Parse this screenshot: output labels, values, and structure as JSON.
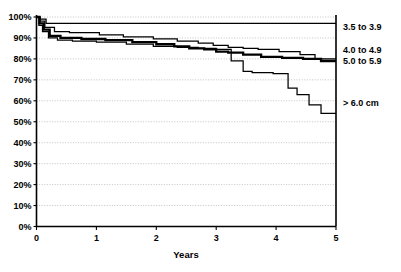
{
  "chart_data": {
    "type": "line",
    "title": "",
    "subtitle": "",
    "xlabel": "Years",
    "ylabel": "",
    "xlim": [
      0,
      5
    ],
    "ylim": [
      0,
      100
    ],
    "grid": true,
    "legend_position": "right",
    "x_ticks": [
      "0",
      "1",
      "2",
      "3",
      "4",
      "5"
    ],
    "x_tick_values": [
      0,
      1,
      2,
      3,
      4,
      5
    ],
    "y_ticks": [
      "0%",
      "10%",
      "20%",
      "30%",
      "40%",
      "50%",
      "60%",
      "70%",
      "80%",
      "90%",
      "100%"
    ],
    "y_tick_values": [
      0,
      10,
      20,
      30,
      40,
      50,
      60,
      70,
      80,
      90,
      100
    ],
    "step_type": "post",
    "series": [
      {
        "name": "3.5 to 3.9",
        "label": "3.5 to 3.9",
        "color": "#000000",
        "line_weight": "thin",
        "final_value": 97,
        "x": [
          0,
          0.06,
          0.16,
          5
        ],
        "y": [
          100,
          99,
          97,
          97
        ]
      },
      {
        "name": "4.0 to 4.9",
        "label": "4.0 to 4.9",
        "color": "#000000",
        "line_weight": "thin",
        "final_value": 80,
        "x": [
          0,
          0.06,
          0.14,
          0.3,
          0.55,
          1.05,
          1.45,
          1.95,
          2.35,
          2.7,
          2.95,
          3.2,
          3.45,
          3.7,
          4.05,
          4.4,
          4.65,
          5
        ],
        "y": [
          100,
          98,
          95,
          93,
          92.5,
          91.5,
          90.5,
          89.5,
          88.5,
          87.5,
          86.5,
          85.5,
          85,
          84.5,
          83.5,
          82,
          80,
          80
        ]
      },
      {
        "name": "5.0 to 5.9",
        "label": "5.0 to 5.9",
        "color": "#000000",
        "line_weight": "thick",
        "final_value": 79,
        "x": [
          0,
          0.05,
          0.12,
          0.22,
          0.4,
          0.75,
          1.15,
          1.6,
          2.0,
          2.3,
          2.55,
          2.8,
          3.0,
          3.2,
          3.45,
          3.75,
          4.1,
          4.45,
          4.75,
          5
        ],
        "y": [
          100,
          97,
          94,
          91,
          90,
          89.5,
          89,
          88,
          87,
          86,
          85,
          84.5,
          83.5,
          83,
          82,
          81,
          80.5,
          80,
          79,
          79
        ]
      },
      {
        "name": "> 6.0 cm",
        "label": "> 6.0 cm",
        "color": "#000000",
        "line_weight": "thin",
        "final_value": 54,
        "x": [
          0,
          0.04,
          0.1,
          0.2,
          0.35,
          0.6,
          1.0,
          1.5,
          1.95,
          2.35,
          2.7,
          3.0,
          3.25,
          3.45,
          3.6,
          3.95,
          4.2,
          4.35,
          4.55,
          4.75,
          5
        ],
        "y": [
          100,
          96,
          93,
          90,
          89,
          88.5,
          88,
          87,
          86,
          85.5,
          85,
          84.5,
          79,
          74,
          73.5,
          73,
          66,
          63,
          58,
          54,
          54
        ]
      }
    ],
    "legend_entries": [
      {
        "label": "3.5 to 3.9",
        "y_percent": 95.5
      },
      {
        "label": "4.0 to 4.9",
        "y_percent": 84.5
      },
      {
        "label": "5.0 to 5.9",
        "y_percent": 79.0
      },
      {
        "label": "> 6.0 cm",
        "y_percent": 59.0
      }
    ]
  }
}
